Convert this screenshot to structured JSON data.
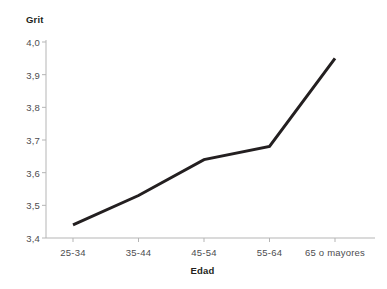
{
  "chart_data": {
    "type": "line",
    "title": "",
    "xlabel": "Edad",
    "ylabel": "Grit",
    "categories": [
      "25-34",
      "35-44",
      "45-54",
      "55-64",
      "65 o mayores"
    ],
    "values": [
      3.44,
      3.53,
      3.64,
      3.68,
      3.95
    ],
    "series": [
      {
        "name": "Grit",
        "values": [
          3.44,
          3.53,
          3.64,
          3.68,
          3.95
        ]
      }
    ],
    "ylim": [
      3.4,
      4.0
    ],
    "ytick_labels": [
      "4,0",
      "3,9",
      "3,8",
      "3,7",
      "3,6",
      "3,5",
      "3,4"
    ],
    "ytick_values": [
      4.0,
      3.9,
      3.8,
      3.7,
      3.6,
      3.5,
      3.4
    ],
    "xtick_labels": [
      "25-34",
      "35-44",
      "45-54",
      "55-64",
      "65 o mayores"
    ],
    "grid": false,
    "legend": "none",
    "line_color": "#231f20",
    "axis_color": "#b5b5b5",
    "label_color": "#4d4d4f",
    "title_color": "#231f20",
    "background_color": "#ffffff"
  },
  "axes": {
    "y_title": "Grit",
    "x_title": "Edad"
  }
}
